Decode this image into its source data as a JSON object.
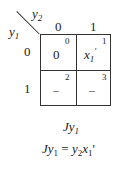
{
  "kmap": {
    "row_var": "y",
    "row_var_sub": "1",
    "col_var": "y",
    "col_var_sub": "2",
    "col_headers": [
      "0",
      "1"
    ],
    "row_headers": [
      "0",
      "1"
    ],
    "cells": [
      {
        "index": "0",
        "value": "0",
        "value_type": "text"
      },
      {
        "index": "1",
        "value": "x",
        "value_sub": "1",
        "value_prime": "'",
        "value_type": "math"
      },
      {
        "index": "2",
        "value": "–",
        "value_type": "dash"
      },
      {
        "index": "3",
        "value": "–",
        "value_type": "dash"
      }
    ]
  },
  "caption": {
    "label_prefix": "J",
    "label_var": "y",
    "label_sub": "1"
  },
  "equation": {
    "lhs_prefix": "J",
    "lhs_var": "y",
    "lhs_sub": "1",
    "eq": " = ",
    "rhs_var1": "y",
    "rhs_sub1": "2",
    "rhs_var2": "x",
    "rhs_sub2": "1",
    "rhs_prime": "'"
  }
}
